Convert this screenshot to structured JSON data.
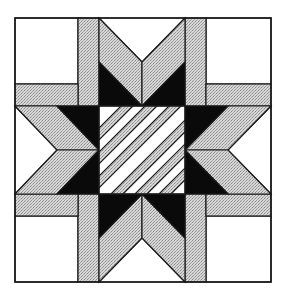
{
  "figure": {
    "title": "",
    "width": 286,
    "height": 295
  },
  "colors": {
    "background": "#ffffff",
    "outline": "#1a1a1a",
    "black_fill": "#0a0a0a",
    "gray_fill": "#d4d4d4",
    "stipple_dot": "#8a8a8a",
    "white_fill": "#ffffff"
  },
  "block": {
    "x": 15,
    "y": 18,
    "x2": 271,
    "y2": 282,
    "cols": [
      15,
      78,
      99,
      142,
      185,
      206,
      271
    ],
    "rows": [
      18,
      84,
      106,
      150,
      194,
      216,
      282
    ]
  },
  "regions": {
    "corner_squares": [
      "top-left",
      "top-right",
      "bottom-left",
      "bottom-right"
    ],
    "star_points": [
      "top",
      "right",
      "bottom",
      "left"
    ],
    "center": "diagonal-striped-square",
    "center_stripes": 7
  }
}
